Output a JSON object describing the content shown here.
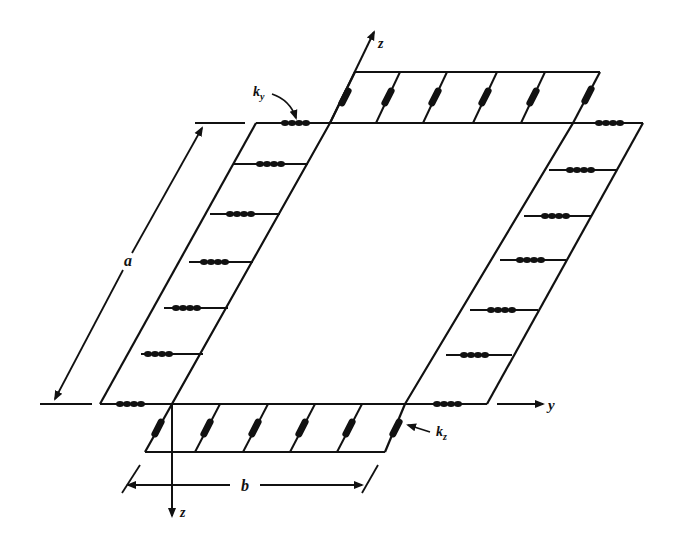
{
  "diagram": {
    "labels": {
      "axis_z_top": "z",
      "axis_z_bottom": "z",
      "axis_y": "y",
      "dim_a": "a",
      "dim_b": "b",
      "spring_ky": "k",
      "spring_ky_sub": "y",
      "spring_kz": "k",
      "spring_kz_sub": "z"
    },
    "colors": {
      "ink": "#111111",
      "background": "#ffffff"
    }
  }
}
